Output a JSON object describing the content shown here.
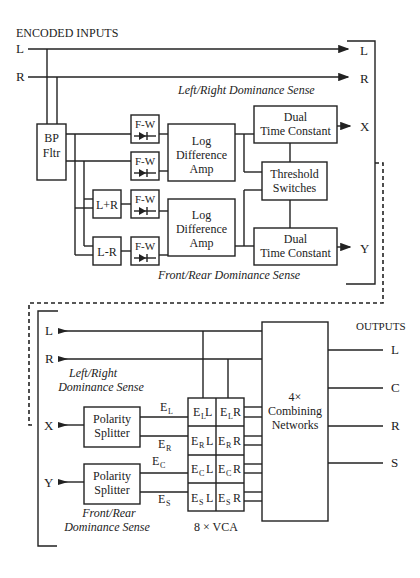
{
  "top": {
    "heading": "ENCODED INPUTS",
    "inputs": [
      "L",
      "R"
    ],
    "outputs": [
      "L",
      "R",
      "X",
      "Y"
    ],
    "lr_sense": "Left/Right Dominance Sense",
    "fr_sense": "Front/Rear Dominance Sense",
    "bp_filter": [
      "BP",
      "Fltr"
    ],
    "fw": "F-W",
    "sum": "L+R",
    "diff": "L-R",
    "log_amp": [
      "Log",
      "Difference",
      "Amp"
    ],
    "dual_tc": [
      "Dual",
      "Time Constant"
    ],
    "threshold": [
      "Threshold",
      "Switches"
    ]
  },
  "bottom": {
    "heading": "OUTPUTS",
    "inputs": [
      "L",
      "R",
      "X",
      "Y"
    ],
    "lr_sense": [
      "Left/Right",
      "Dominance Sense"
    ],
    "fr_sense": [
      "Front/Rear",
      "Dominance Sense"
    ],
    "splitter": [
      "Polarity",
      "Splitter"
    ],
    "e_labels": [
      {
        "base": "E",
        "sub": "L"
      },
      {
        "base": "E",
        "sub": "R"
      },
      {
        "base": "E",
        "sub": "C"
      },
      {
        "base": "E",
        "sub": "S"
      }
    ],
    "vca_cells": [
      [
        {
          "sub": "L",
          "ch": "L"
        },
        {
          "sub": "L",
          "ch": "R"
        }
      ],
      [
        {
          "sub": "R",
          "ch": "L"
        },
        {
          "sub": "R",
          "ch": "R"
        }
      ],
      [
        {
          "sub": "C",
          "ch": "L"
        },
        {
          "sub": "C",
          "ch": "R"
        }
      ],
      [
        {
          "sub": "S",
          "ch": "L"
        },
        {
          "sub": "S",
          "ch": "R"
        }
      ]
    ],
    "vca_label": "8 × VCA",
    "combining": [
      "4×",
      "Combining",
      "Networks"
    ],
    "outputs": [
      "L",
      "C",
      "R",
      "S"
    ]
  }
}
